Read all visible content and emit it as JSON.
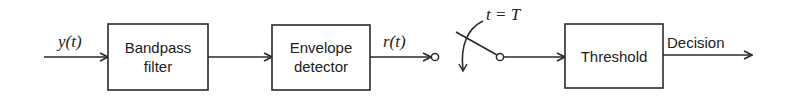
{
  "diagram": {
    "input_signal": "y(t)",
    "blocks": [
      {
        "id": "bandpass",
        "lines": [
          "Bandpass",
          "filter"
        ]
      },
      {
        "id": "envelope",
        "lines": [
          "Envelope",
          "detector"
        ]
      },
      {
        "id": "threshold",
        "lines": [
          "Threshold"
        ]
      }
    ],
    "intermediate_signal": "r(t)",
    "switch_label": "t = T",
    "output_label": "Decision",
    "colors": {
      "stroke": "#2a2a2a",
      "text": "#222222",
      "background": "#ffffff"
    }
  }
}
